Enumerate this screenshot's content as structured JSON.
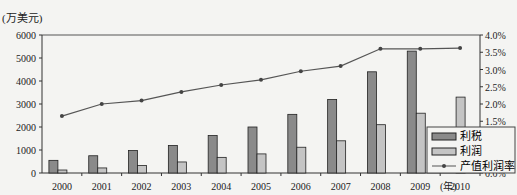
{
  "chart_data": {
    "type": "bar",
    "title": "",
    "ylabel_left": "(万美元)",
    "xlabel": "(年)",
    "categories": [
      "2000",
      "2001",
      "2002",
      "2003",
      "2004",
      "2005",
      "2006",
      "2007",
      "2008",
      "2009",
      "2010"
    ],
    "series": [
      {
        "name": "利税",
        "type": "bar",
        "values": [
          550,
          750,
          980,
          1200,
          1630,
          2000,
          2550,
          3200,
          4400,
          5300,
          null
        ],
        "color": "#8a8a8a"
      },
      {
        "name": "利润",
        "type": "bar",
        "values": [
          130,
          220,
          330,
          480,
          680,
          830,
          1120,
          1400,
          2100,
          2600,
          3300
        ],
        "color": "#c4c4c4"
      },
      {
        "name": "产值利润率",
        "type": "line",
        "axis": "right",
        "values": [
          1.65,
          2.0,
          2.1,
          2.35,
          2.55,
          2.7,
          2.95,
          3.1,
          3.6,
          3.6,
          3.62
        ],
        "color": "#555555"
      }
    ],
    "ylim_left": [
      0,
      6000
    ],
    "yticks_left": [
      "0",
      "1000",
      "2000",
      "3000",
      "4000",
      "5000",
      "6000"
    ],
    "ylim_right": [
      0,
      4.0
    ],
    "yticks_right": [
      "0.0%",
      "0.5%",
      "1.0%",
      "1.5%",
      "2.0%",
      "2.5%",
      "3.0%",
      "3.5%",
      "4.0%"
    ],
    "legend": {
      "position": "right-bottom",
      "entries": [
        "利税",
        "利润",
        "产值利润率"
      ]
    }
  }
}
